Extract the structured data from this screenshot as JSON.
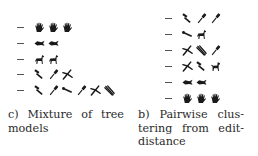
{
  "figure": {
    "panels": [
      {
        "id": "c",
        "caption_lines": [
          "c) Mixture of tree",
          "models"
        ],
        "caption_words_line1": [
          "c)",
          "Mixture",
          "of",
          "tree"
        ],
        "rows": [
          {
            "icons": [
              "hand-icon",
              "hand-icon",
              "hand-icon"
            ]
          },
          {
            "icons": [
              "fish-icon",
              "fish-icon"
            ]
          },
          {
            "icons": [
              "horse-icon",
              "horse-icon"
            ]
          },
          {
            "icons": [
              "hammer-icon",
              "screwdriver-icon",
              "pliers-icon"
            ]
          },
          {
            "icons": [
              "hammer-icon",
              "screwdriver-icon",
              "wrench-icon",
              "screwdriver-icon",
              "pliers-icon",
              "scissors-icon"
            ]
          }
        ]
      },
      {
        "id": "b",
        "caption_lines": [
          "b) Pairwise clus-",
          "tering from edit-",
          "distance"
        ],
        "caption_words": [
          [
            "b)",
            "Pairwise",
            "clus-"
          ],
          [
            "tering",
            "from",
            "edit-"
          ],
          [
            "distance"
          ]
        ],
        "rows": [
          {
            "icons": [
              "hammer-icon",
              "screwdriver-icon",
              "screwdriver-icon"
            ]
          },
          {
            "icons": [
              "wrench-icon",
              "horse-icon"
            ]
          },
          {
            "icons": [
              "pliers-icon",
              "scissors-icon",
              "screwdriver-icon"
            ]
          },
          {
            "icons": [
              "pliers-icon",
              "hammer-icon",
              "dog-icon"
            ]
          },
          {
            "icons": [
              "fish-icon",
              "fish-icon"
            ]
          },
          {
            "icons": [
              "hand-icon",
              "hand-icon",
              "hand-icon"
            ]
          }
        ]
      }
    ],
    "colors": {
      "ink": "#1a1a1a",
      "dash": "#555555",
      "background": "#ffffff"
    }
  }
}
